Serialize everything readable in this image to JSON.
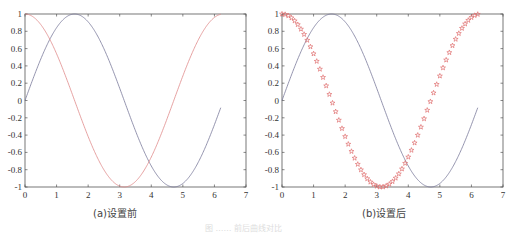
{
  "chart_data": [
    {
      "type": "line",
      "caption": "(a)设置前",
      "xlim": [
        0,
        7
      ],
      "ylim": [
        -1,
        1
      ],
      "xticks": [
        0,
        1,
        2,
        3,
        4,
        5,
        6,
        7
      ],
      "yticks": [
        "-1",
        "-0.8",
        "-0.6",
        "-0.4",
        "-0.2",
        "0",
        "0.2",
        "0.4",
        "0.6",
        "0.8",
        "1"
      ],
      "grid": false,
      "series": [
        {
          "name": "sin(x)",
          "color": "#7a7a9a",
          "style": "solid",
          "x_range": [
            0,
            6.2
          ],
          "function": "sin"
        },
        {
          "name": "cos(x)",
          "color": "#e08a8a",
          "style": "solid",
          "x_range": [
            0,
            6.2
          ],
          "function": "cos"
        }
      ]
    },
    {
      "type": "line",
      "caption": "(b)设置后",
      "xlim": [
        0,
        7
      ],
      "ylim": [
        -1,
        1
      ],
      "xticks": [
        0,
        1,
        2,
        3,
        4,
        5,
        6,
        7
      ],
      "yticks": [
        "-1",
        "-0.8",
        "-0.6",
        "-0.4",
        "-0.2",
        "0",
        "0.2",
        "0.4",
        "0.6",
        "0.8",
        "1"
      ],
      "grid": false,
      "series": [
        {
          "name": "sin(x)",
          "color": "#7a7a9a",
          "style": "solid",
          "x_range": [
            0,
            6.2
          ],
          "function": "sin"
        },
        {
          "name": "cos(x)",
          "color": "#e07070",
          "style": "pentagram markers",
          "x_range": [
            0,
            6.2
          ],
          "step": 0.1,
          "function": "cos"
        }
      ]
    }
  ],
  "captions": {
    "a": "(a)设置前",
    "b": "(b)设置后",
    "figure": "图  ……  前后曲线对比"
  }
}
